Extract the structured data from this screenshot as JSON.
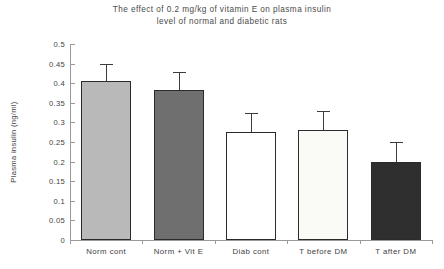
{
  "chart_data": {
    "type": "bar",
    "title": "The effect of 0.2 mg/kg of vitamin E on plasma insulin\nlevel of normal and diabetic rats",
    "xlabel": "",
    "ylabel": "Plasma insulin (ng/ml)",
    "ylim": [
      0,
      0.5
    ],
    "grid": false,
    "legend": "none",
    "ytick_labels": [
      "0.5",
      "0.45",
      "0.4",
      "0.35",
      "0.3",
      "0.25",
      "0.2",
      "0.15",
      "0.1",
      "0.05",
      "0"
    ],
    "ytick_values": [
      0.5,
      0.45,
      0.4,
      0.35,
      0.3,
      0.25,
      0.2,
      0.15,
      0.1,
      0.05,
      0
    ],
    "categories": [
      "Norm cont",
      "Norm + Vit E",
      "Diab cont",
      "T before DM",
      "T after DM"
    ],
    "values": [
      0.405,
      0.383,
      0.275,
      0.281,
      0.199
    ],
    "errors": [
      0.045,
      0.045,
      0.05,
      0.048,
      0.05
    ],
    "bar_colors": [
      "#b9b9b9",
      "#6f6f6f",
      "#ffffff",
      "#fafaf6",
      "#2f2f2f"
    ],
    "bar_border_color": "#2b2b2b",
    "error_bar_color": "#3c3c3c",
    "axis_color": "#9a9a9a",
    "text_color": "#3e3e3e",
    "background": "#ffffff"
  }
}
